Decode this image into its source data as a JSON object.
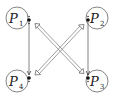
{
  "diagram": {
    "type": "process-graph",
    "colors": {
      "stroke": "#555555",
      "text": "#222222",
      "background": "#ffffff"
    },
    "nodes": [
      {
        "id": "P1",
        "letter": "P",
        "sub": "1",
        "cx": 17,
        "cy": 18
      },
      {
        "id": "P2",
        "letter": "P",
        "sub": "2",
        "cx": 97,
        "cy": 18
      },
      {
        "id": "P3",
        "letter": "P",
        "sub": "3",
        "cx": 97,
        "cy": 81
      },
      {
        "id": "P4",
        "letter": "P",
        "sub": "4",
        "cx": 17,
        "cy": 81
      }
    ],
    "edges": [
      {
        "from": "P1",
        "to": "P4",
        "style": "single-line",
        "arrow": "down"
      },
      {
        "from": "P2",
        "to": "P3",
        "style": "single-line",
        "arrow": "down"
      },
      {
        "from": "P1",
        "to": "P3",
        "style": "double-line",
        "arrow": "both"
      },
      {
        "from": "P2",
        "to": "P4",
        "style": "double-line",
        "arrow": "both"
      }
    ]
  }
}
